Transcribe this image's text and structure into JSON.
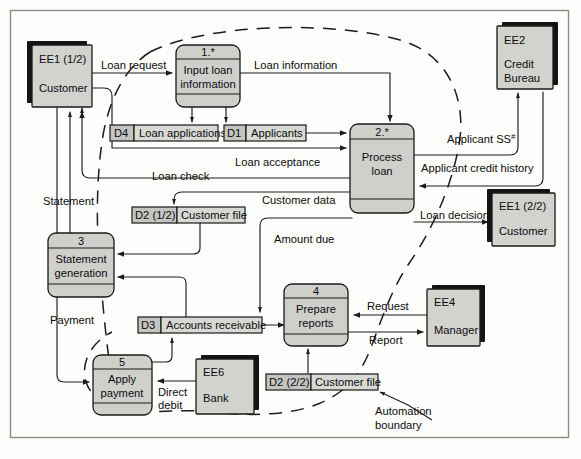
{
  "diagram": {
    "type": "data-flow-diagram",
    "colors": {
      "entity_fill": "#d2d2cf",
      "process_fill": "#cfcfcc",
      "store_fill": "#d8d8d5",
      "store_id_fill": "#c4c4c1",
      "stroke": "#1a1a1a",
      "frame": "#8a8a86",
      "background": "#fdfdfb"
    }
  },
  "entities": [
    {
      "id": "EE1 (1/2)",
      "name": "Customer"
    },
    {
      "id": "EE2",
      "name": "Credit",
      "name2": "Bureau"
    },
    {
      "id": "EE1 (2/2)",
      "name": "Customer"
    },
    {
      "id": "EE4",
      "name": "Manager"
    },
    {
      "id": "EE6",
      "name": "Bank"
    }
  ],
  "processes": [
    {
      "number": "1.*",
      "line1": "Input loan",
      "line2": "information"
    },
    {
      "number": "2.*",
      "line1": "Process",
      "line2": "loan"
    },
    {
      "number": "3",
      "line1": "Statement",
      "line2": "generation"
    },
    {
      "number": "4",
      "line1": "Prepare",
      "line2": "reports"
    },
    {
      "number": "5",
      "line1": "Apply",
      "line2": "payment"
    }
  ],
  "data_stores": [
    {
      "id": "D4",
      "name": "Loan applications"
    },
    {
      "id": "D1",
      "name": "Applicants"
    },
    {
      "id": "D2 (1/2)",
      "name": "Customer file"
    },
    {
      "id": "D3",
      "name": "Accounts receivable"
    },
    {
      "id": "D2 (2/2)",
      "name": "Customer file"
    }
  ],
  "flows": [
    {
      "label": "Loan request"
    },
    {
      "label": "Loan information"
    },
    {
      "label": "Loan acceptance"
    },
    {
      "label": "Loan check"
    },
    {
      "label": "Customer data"
    },
    {
      "label": "Applicant SS",
      "superscript": "#"
    },
    {
      "label": "Applicant credit history"
    },
    {
      "label": "Loan decision"
    },
    {
      "label": "Amount due"
    },
    {
      "label": "Statement"
    },
    {
      "label": "Payment"
    },
    {
      "label": "Request"
    },
    {
      "label": "Report"
    },
    {
      "label": "Direct",
      "label2": "debit"
    }
  ],
  "annotations": [
    {
      "line1": "Automation",
      "line2": "boundary"
    }
  ]
}
